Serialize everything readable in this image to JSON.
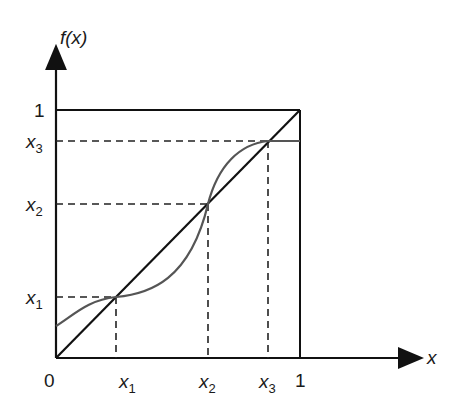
{
  "diagram": {
    "y_axis_label": "f(x)",
    "x_axis_label": "x",
    "origin_label": "0",
    "unit_label_x": "1",
    "unit_label_y": "1",
    "x_ticks": [
      {
        "base": "x",
        "sub": "1"
      },
      {
        "base": "x",
        "sub": "2"
      },
      {
        "base": "x",
        "sub": "3"
      }
    ],
    "y_ticks": [
      {
        "base": "x",
        "sub": "1"
      },
      {
        "base": "x",
        "sub": "2"
      },
      {
        "base": "x",
        "sub": "3"
      }
    ],
    "elements": {
      "identity_line": "y = x diagonal",
      "unit_square": "box [0,1] x [0,1]",
      "curve": "f(x) intersecting diagonal at x1, x2, x3",
      "guides": "dashed projection lines to axes"
    },
    "fixed_points": [
      {
        "x": 0.25,
        "f": 0.25
      },
      {
        "x": 0.62,
        "f": 0.62
      },
      {
        "x": 0.87,
        "f": 0.87
      }
    ],
    "curve_start_value": 0.13,
    "colors": {
      "axis": "#111111",
      "curve": "#555555",
      "dashes": "#222222"
    }
  }
}
